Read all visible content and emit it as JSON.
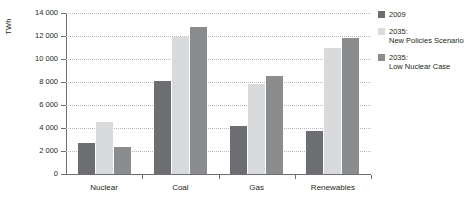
{
  "chart_data": {
    "type": "bar",
    "title": "",
    "xlabel": "",
    "ylabel": "TWh",
    "ylim": [
      0,
      14000
    ],
    "ytick_step": 2000,
    "grid": true,
    "legend_position": "right",
    "categories": [
      "Nuclear",
      "Coal",
      "Gas",
      "Renewables"
    ],
    "ytick_labels": [
      "0",
      "2 000",
      "4 000",
      "6 000",
      "8 000",
      "10 000",
      "12 000",
      "14 000"
    ],
    "ytick_values": [
      0,
      2000,
      4000,
      6000,
      8000,
      10000,
      12000,
      14000
    ],
    "series": [
      {
        "name": "2009",
        "color": "#6d6e71",
        "values": [
          2700,
          8050,
          4200,
          3700
        ]
      },
      {
        "name": "2035: New Policies Scenario",
        "color": "#d9dadb",
        "values": [
          4550,
          11900,
          7800,
          11000
        ]
      },
      {
        "name": "2035: Low Nuclear Case",
        "color": "#8a8c8e",
        "values": [
          2380,
          12800,
          8500,
          11800
        ]
      }
    ]
  },
  "legend": {
    "items": [
      {
        "line1": "2009",
        "line2": ""
      },
      {
        "line1": "2035:",
        "line2": "New Policies Scenario"
      },
      {
        "line1": "2035:",
        "line2": "Low Nuclear Case"
      }
    ]
  },
  "colors": {
    "series_2009": "#6d6e71",
    "series_new_policies": "#d9dadb",
    "series_low_nuclear": "#8a8c8e",
    "axis": "#6d6e71",
    "grid": "#b9b9b9",
    "text": "#231f20"
  }
}
